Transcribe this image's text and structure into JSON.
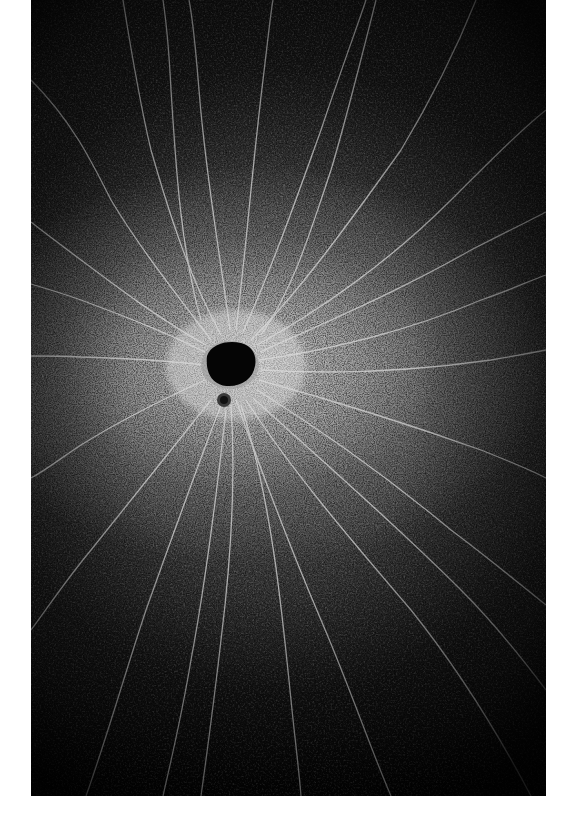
{
  "image": {
    "subject": "aerial view of a dark waterhole with pale animal trails radiating across a grey plain",
    "palette": {
      "background": "#ffffff",
      "field_dark": "#1a1a1a",
      "halo": "#cdcdcd",
      "waterhole": "#050505",
      "trails": "#d8d8d8"
    },
    "features": {
      "waterhole": {
        "cx": 199,
        "cy": 365,
        "rx": 25,
        "ry": 20
      },
      "small_pit": {
        "cx": 193,
        "cy": 400,
        "r": 7
      }
    }
  }
}
